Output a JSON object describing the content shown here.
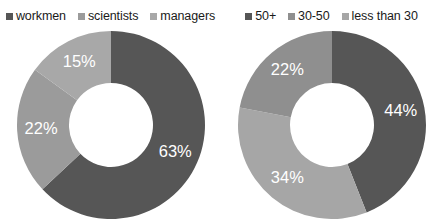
{
  "chart_data": [
    {
      "type": "pie",
      "title": "",
      "chart_name": "occupation-donut",
      "donut": true,
      "legend_position": "top",
      "categories": [
        "workmen",
        "scientists",
        "managers"
      ],
      "values": [
        63,
        22,
        15
      ],
      "labels": [
        "63%",
        "22%",
        "15%"
      ],
      "colors": [
        "#565656",
        "#9b9b9b",
        "#a8a8a8"
      ],
      "start_angle_deg": 0,
      "direction": "clockwise",
      "units": "percent"
    },
    {
      "type": "pie",
      "title": "",
      "chart_name": "age-donut",
      "donut": true,
      "legend_position": "top",
      "categories": [
        "50+",
        "30-50",
        "less than 30"
      ],
      "values": [
        44,
        34,
        22
      ],
      "labels": [
        "44%",
        "34%",
        "22%"
      ],
      "colors": [
        "#565656",
        "#a6a6a6",
        "#8f8f8f"
      ],
      "start_angle_deg": 0,
      "direction": "clockwise",
      "units": "percent"
    }
  ],
  "charts": {
    "left": {
      "legend": [
        {
          "label": "workmen",
          "color": "#565656"
        },
        {
          "label": "scientists",
          "color": "#9b9b9b"
        },
        {
          "label": "managers",
          "color": "#a8a8a8"
        }
      ],
      "slices": [
        {
          "label": "63%",
          "value": 63,
          "color": "#565656"
        },
        {
          "label": "22%",
          "value": 22,
          "color": "#9b9b9b"
        },
        {
          "label": "15%",
          "value": 15,
          "color": "#a8a8a8"
        }
      ]
    },
    "right": {
      "legend": [
        {
          "label": "50+",
          "color": "#565656"
        },
        {
          "label": "30-50",
          "color": "#8f8f8f"
        },
        {
          "label": "less than 30",
          "color": "#a6a6a6"
        }
      ],
      "slices": [
        {
          "label": "44%",
          "value": 44,
          "color": "#565656"
        },
        {
          "label": "34%",
          "value": 34,
          "color": "#a6a6a6"
        },
        {
          "label": "22%",
          "value": 22,
          "color": "#8f8f8f"
        }
      ]
    }
  }
}
